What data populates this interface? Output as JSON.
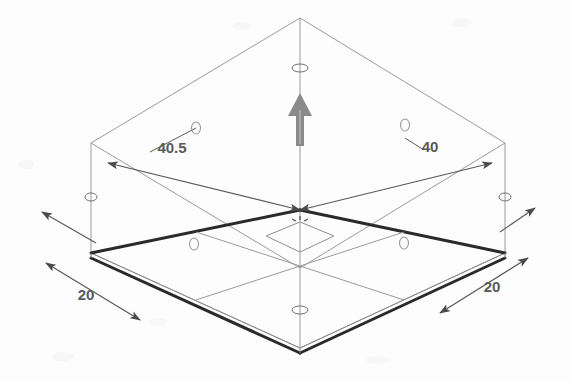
{
  "view": {
    "title": "Isometric wireframe plate with dimension annotations",
    "background_color": "#fdfdfd",
    "model_line_color": "#3a3a3a",
    "construction_line_color": "#8c8c8c",
    "dimension_line_color": "#595959",
    "handle_color": "#808080",
    "width": 572,
    "height": 381
  },
  "dimensions": [
    {
      "id": "dim-upper-left",
      "label": "40.5",
      "label_x": 172,
      "label_y": 153,
      "from_x": 300,
      "from_y": 210,
      "to_x": 108,
      "to_y": 163,
      "units": ""
    },
    {
      "id": "dim-upper-right",
      "label": "40",
      "label_x": 430,
      "label_y": 152,
      "from_x": 300,
      "from_y": 210,
      "to_x": 492,
      "to_y": 163,
      "units": ""
    },
    {
      "id": "dim-lower-left",
      "label": "20",
      "label_x": 86,
      "label_y": 300,
      "from_x": 46,
      "from_y": 263,
      "to_x": 140,
      "to_y": 320,
      "units": ""
    },
    {
      "id": "dim-lower-right",
      "label": "20",
      "label_x": 492,
      "label_y": 292,
      "from_x": 528,
      "from_y": 258,
      "to_x": 440,
      "to_y": 313,
      "units": ""
    }
  ],
  "handles": {
    "drag_arrow": {
      "name": "vertical-drag-arrow",
      "x": 300,
      "y": 100,
      "direction": "up",
      "color": "#808080"
    },
    "endpoint_markers": [
      {
        "id": "marker-top-axis",
        "x": 300,
        "y": 68
      },
      {
        "id": "marker-bottom-axis",
        "x": 300,
        "y": 310
      },
      {
        "id": "marker-left-edge",
        "x": 91,
        "y": 197
      },
      {
        "id": "marker-right-edge",
        "x": 505,
        "y": 197
      }
    ],
    "hole_markers": [
      {
        "id": "hole-upper-left",
        "x": 196,
        "y": 128
      },
      {
        "id": "hole-upper-right",
        "x": 405,
        "y": 125
      },
      {
        "id": "hole-lower-left",
        "x": 194,
        "y": 244
      },
      {
        "id": "hole-lower-right",
        "x": 404,
        "y": 243
      }
    ],
    "center_point": {
      "id": "origin-crosshair",
      "x": 300,
      "y": 222
    }
  },
  "geometry": {
    "bounding_box": {
      "top_apex": {
        "x": 300,
        "y": 18
      },
      "top_left": {
        "x": 91,
        "y": 143
      },
      "top_right": {
        "x": 505,
        "y": 143
      },
      "top_far": {
        "x": 300,
        "y": 18
      },
      "bottom_apex": {
        "x": 300,
        "y": 268
      },
      "bottom_left": {
        "x": 91,
        "y": 253
      },
      "bottom_right": {
        "x": 505,
        "y": 253
      }
    },
    "plate_top_face": {
      "north": {
        "x": 300,
        "y": 210
      },
      "west": {
        "x": 91,
        "y": 253
      },
      "south": {
        "x": 300,
        "y": 348
      },
      "east": {
        "x": 505,
        "y": 253
      }
    },
    "plate_thickness_px": 7
  }
}
